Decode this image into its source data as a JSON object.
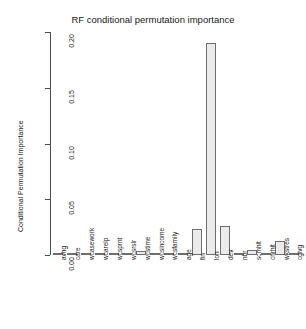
{
  "chart_data": {
    "type": "bar",
    "title": "RF conditional permutation importance",
    "xlabel": "",
    "ylabel": "Conditional Permutation Importance",
    "ylim": [
      0.0,
      0.2
    ],
    "ytick_labels": [
      "0.00",
      "0.05",
      "0.10",
      "0.15",
      "0.20"
    ],
    "ytick_values": [
      0.0,
      0.05,
      0.1,
      0.15,
      0.2
    ],
    "grid": false,
    "legend": false,
    "bar_fill_color": "#ebebeb",
    "bar_border_color": "#6e6e6e",
    "categories": [
      "avhg",
      "care",
      "wcasework",
      "wcarelp",
      "wcsprnt",
      "wcsrslr",
      "wcstime",
      "wcsincome",
      "wcsfamily",
      "age",
      "fin",
      "lon",
      "dev",
      "nbr",
      "scmhlt",
      "chrhlt",
      "wkstres",
      "cgivg"
    ],
    "values": [
      0.0005,
      0.0004,
      0.0018,
      0.0004,
      0.0016,
      0.0004,
      0.004,
      0.0013,
      0.0003,
      0.0018,
      0.0235,
      0.1905,
      0.0258,
      0.0015,
      0.0042,
      0.0002,
      0.0128,
      0.0008
    ]
  }
}
